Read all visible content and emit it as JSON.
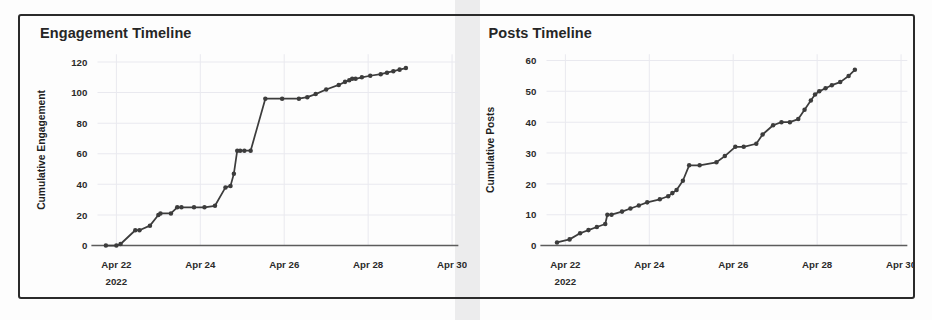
{
  "figure": {
    "background_color": "#fdfdfd",
    "border_color": "#2b2b2b",
    "line_color": "#3c3c3c",
    "grid_color": "#e9e9ef"
  },
  "panels": [
    {
      "title": "Engagement Timeline"
    },
    {
      "title": "Posts Timeline"
    }
  ],
  "chart_data": [
    {
      "type": "line",
      "title": "Engagement Timeline",
      "xlabel": "",
      "ylabel": "Cumulative Engagement",
      "grid": true,
      "legend": false,
      "xtick_labels": [
        "Apr 22",
        "Apr 24",
        "Apr 26",
        "Apr 28",
        "Apr 30"
      ],
      "xtick_sublabel": "2022",
      "xtick_sublabel_index": 0,
      "ytick_labels": [
        "0",
        "20",
        "40",
        "60",
        "80",
        "100",
        "120"
      ],
      "ylim": [
        0,
        125
      ],
      "xlim": [
        "2022-04-21.55",
        "2022-04-30.15"
      ],
      "markers": true,
      "x": [
        21.75,
        22.0,
        22.1,
        22.45,
        22.55,
        22.8,
        23.0,
        23.05,
        23.3,
        23.45,
        23.55,
        23.85,
        24.1,
        24.35,
        24.6,
        24.72,
        24.8,
        24.88,
        24.95,
        25.05,
        25.2,
        25.55,
        25.95,
        26.35,
        26.55,
        26.75,
        27.0,
        27.3,
        27.45,
        27.55,
        27.62,
        27.7,
        27.85,
        28.05,
        28.3,
        28.45,
        28.6,
        28.75,
        28.9
      ],
      "y": [
        0,
        0,
        1,
        10,
        10,
        13,
        20,
        21,
        21,
        25,
        25,
        25,
        25,
        26,
        38,
        39,
        47,
        62,
        62,
        62,
        62,
        96,
        96,
        96,
        97,
        99,
        102,
        105,
        107,
        108,
        109,
        109,
        110,
        111,
        112,
        113,
        114,
        115,
        116
      ]
    },
    {
      "type": "line",
      "title": "Posts Timeline",
      "xlabel": "",
      "ylabel": "Cumulative Posts",
      "grid": true,
      "legend": false,
      "xtick_labels": [
        "Apr 22",
        "Apr 24",
        "Apr 26",
        "Apr 28",
        "Apr 30"
      ],
      "xtick_sublabel": "2022",
      "xtick_sublabel_index": 0,
      "ytick_labels": [
        "0",
        "10",
        "20",
        "30",
        "40",
        "50",
        "60"
      ],
      "ylim": [
        0,
        62
      ],
      "xlim": [
        "2022-04-21.55",
        "2022-04-30.15"
      ],
      "markers": true,
      "x": [
        21.8,
        22.1,
        22.35,
        22.55,
        22.75,
        22.95,
        23.0,
        23.1,
        23.35,
        23.55,
        23.75,
        23.95,
        24.25,
        24.45,
        24.55,
        24.65,
        24.8,
        24.95,
        25.2,
        25.6,
        25.8,
        26.05,
        26.25,
        26.55,
        26.7,
        26.95,
        27.15,
        27.35,
        27.55,
        27.7,
        27.85,
        27.95,
        28.05,
        28.2,
        28.35,
        28.55,
        28.75,
        28.9
      ],
      "y": [
        1,
        2,
        4,
        5,
        6,
        7,
        10,
        10,
        11,
        12,
        13,
        14,
        15,
        16,
        17,
        18,
        21,
        26,
        26,
        27,
        29,
        32,
        32,
        33,
        36,
        39,
        40,
        40,
        41,
        44,
        47,
        49,
        50,
        51,
        52,
        53,
        55,
        57
      ]
    }
  ]
}
